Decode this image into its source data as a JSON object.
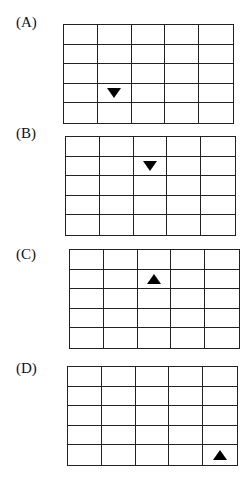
{
  "figure": {
    "rows": 5,
    "cols": 5,
    "options": [
      {
        "label": "(A)",
        "marker": {
          "shape": "triangle",
          "direction": "down",
          "row": 4,
          "col": 2
        },
        "label_pos": [
          16,
          15
        ],
        "grid_pos": [
          63,
          24
        ]
      },
      {
        "label": "(B)",
        "marker": {
          "shape": "triangle",
          "direction": "down",
          "row": 2,
          "col": 3
        },
        "label_pos": [
          16,
          126
        ],
        "grid_pos": [
          65,
          136
        ]
      },
      {
        "label": "(C)",
        "marker": {
          "shape": "triangle",
          "direction": "up",
          "row": 2,
          "col": 3
        },
        "label_pos": [
          16,
          247
        ],
        "grid_pos": [
          69,
          249
        ]
      },
      {
        "label": "(D)",
        "marker": {
          "shape": "triangle",
          "direction": "up",
          "row": 5,
          "col": 5
        },
        "label_pos": [
          16,
          361
        ],
        "grid_pos": [
          67,
          366
        ]
      }
    ]
  }
}
